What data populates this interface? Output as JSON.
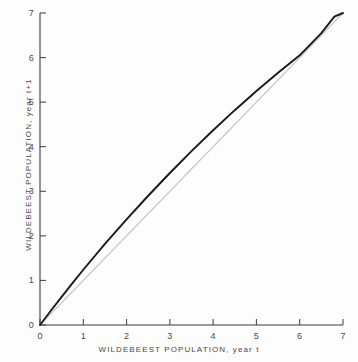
{
  "chart_data": {
    "type": "line",
    "title": "",
    "xlabel": "WILDEBEEST POPULATION, year t",
    "ylabel": "WILDEBEEST POPULATION, year t+1",
    "xlim": [
      0,
      7
    ],
    "ylim": [
      0,
      7
    ],
    "xticks": [
      "0",
      "1",
      "2",
      "3",
      "4",
      "5",
      "6",
      "7"
    ],
    "yticks": [
      "0",
      "1",
      "2",
      "3",
      "4",
      "5",
      "6",
      "7"
    ],
    "grid": false,
    "legend": "none",
    "series": [
      {
        "name": "recruitment-curve",
        "color": "#1a1a1a",
        "x": [
          0,
          0.25,
          0.5,
          0.75,
          1,
          1.5,
          2,
          2.5,
          3,
          3.5,
          4,
          4.5,
          5,
          5.5,
          6,
          6.5,
          6.8,
          7
        ],
        "values": [
          0,
          0.32,
          0.63,
          0.94,
          1.24,
          1.82,
          2.37,
          2.9,
          3.41,
          3.9,
          4.37,
          4.82,
          5.25,
          5.66,
          6.05,
          6.55,
          6.92,
          7.0
        ]
      },
      {
        "name": "replacement-line",
        "color": "#c8c8c8",
        "x": [
          0,
          7
        ],
        "values": [
          0,
          7
        ]
      }
    ]
  },
  "axis": {
    "x_title": "WILDEBEEST POPULATION, year t",
    "y_title": "WILDEBEEST POPULATION, year t+1"
  },
  "colors": {
    "background": "#fdfdfd",
    "axis": "#3c3c3c",
    "curve": "#1a1a1a",
    "diagonal": "#c8c8c8",
    "text": "#4a4a4a"
  }
}
